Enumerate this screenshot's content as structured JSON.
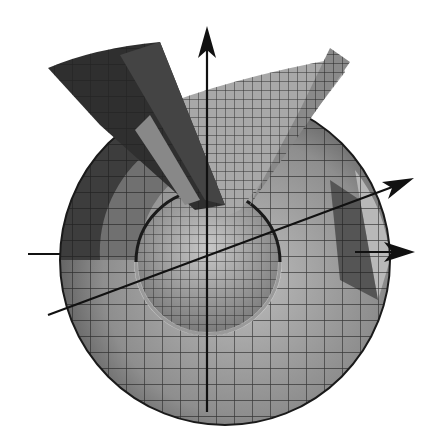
{
  "figure": {
    "colors": {
      "background": "#ffffff",
      "outer_shell_dark": "#3a3a3a",
      "outer_shell_mid": "#6e6e6e",
      "outer_shell_light": "#b0b0b0",
      "inner_sphere": "#9a9a9a",
      "cone": "#a8a8a8",
      "cone_dark": "#2e2e2e",
      "grid_lines": "#1a1a1a",
      "axes": "#111111"
    },
    "axes": [
      {
        "name": "vertical-axis",
        "direction": "up"
      },
      {
        "name": "horizontal-axis",
        "direction": "right"
      },
      {
        "name": "diagonal-axis",
        "direction": "up-right"
      }
    ]
  }
}
